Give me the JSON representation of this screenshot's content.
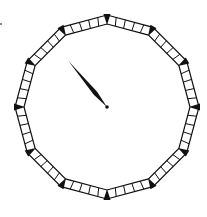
{
  "diagram": {
    "type": "clock-face",
    "shape": "dodecagon",
    "vertices": 12,
    "cells_per_side": 5,
    "center": [
      107,
      107
    ],
    "outer_radius": 92,
    "inner_radius": 83,
    "hand": {
      "count": 1,
      "angle_deg": -40,
      "length": 60,
      "pointing_to_minute": 53
    },
    "colors": {
      "stroke": "#111111",
      "marker": "#111111",
      "background": "#ffffff"
    }
  }
}
